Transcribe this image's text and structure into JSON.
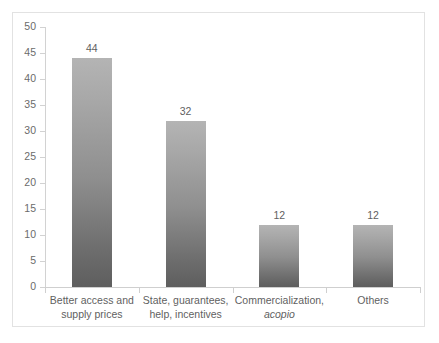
{
  "chart_data": {
    "type": "bar",
    "title": "",
    "subtitle": "",
    "xlabel": "",
    "ylabel": "",
    "categories": [
      "Better access and supply prices",
      "State, guarantees, help, incentives",
      "Commercialization, acopio",
      "Others"
    ],
    "category_lines": [
      [
        "Better access and",
        "supply prices"
      ],
      [
        "State, guarantees,",
        "help, incentives"
      ],
      [
        "Commercialization,",
        "acopio"
      ],
      [
        "Others"
      ]
    ],
    "category_line2_italic": [
      false,
      false,
      true,
      false
    ],
    "values": [
      44,
      32,
      12,
      12
    ],
    "data_labels": [
      "44",
      "32",
      "12",
      "12"
    ],
    "ylim": [
      0,
      50
    ],
    "ytick_step": 5,
    "ytick_labels": [
      "0",
      "5",
      "10",
      "15",
      "20",
      "25",
      "30",
      "35",
      "40",
      "45",
      "50"
    ],
    "grid": false,
    "legend": "none",
    "bar_color_top": "#b4b4b4",
    "bar_color_bottom": "#5e5e5e",
    "axis_color": "#cfcfcf",
    "text_color": "#5f5f5f",
    "frame_color": "#e2e2e2"
  }
}
